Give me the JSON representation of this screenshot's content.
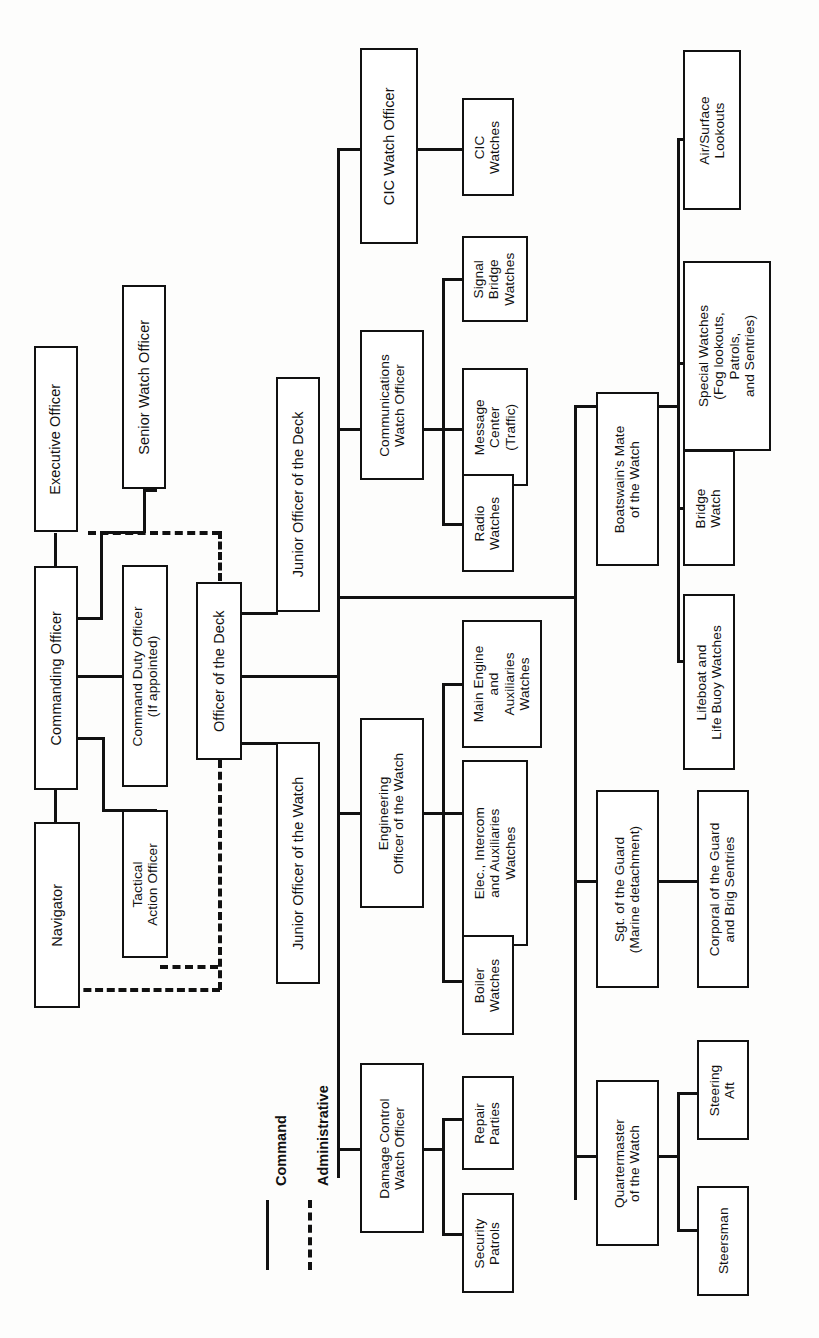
{
  "diagram": {
    "orientation": "rotated-90-counterclockwise",
    "legend": {
      "command_label": "Command",
      "command_style": "solid",
      "administrative_label": "Administrative",
      "administrative_style": "dashed"
    },
    "nodes": [
      {
        "id": "navigator",
        "label": "Navigator"
      },
      {
        "id": "commanding",
        "label": "Commanding Officer"
      },
      {
        "id": "executive",
        "label": "Executive Officer"
      },
      {
        "id": "senior_watch",
        "label": "Senior Watch Officer"
      },
      {
        "id": "command_duty",
        "label": "Command Duty Officer\n(If appointed)"
      },
      {
        "id": "tactical_action",
        "label": "Tactical\nAction Officer"
      },
      {
        "id": "ood",
        "label": "Officer of the Deck"
      },
      {
        "id": "jood",
        "label": "Junior Officer of the Deck"
      },
      {
        "id": "joow",
        "label": "Junior Officer of the Watch"
      },
      {
        "id": "cic_wo",
        "label": "CIC Watch Officer"
      },
      {
        "id": "cic_watches",
        "label": "CIC\nWatches"
      },
      {
        "id": "comm_wo",
        "label": "Communications\nWatch Officer"
      },
      {
        "id": "signal_bridge",
        "label": "Signal\nBridge\nWatches"
      },
      {
        "id": "message_center",
        "label": "Message\nCenter\n(Traffic)"
      },
      {
        "id": "radio_watches",
        "label": "Radio\nWatches"
      },
      {
        "id": "eng_oow",
        "label": "Engineering\nOfficer of the Watch"
      },
      {
        "id": "main_engine",
        "label": "Main Engine\nand\nAuxiliaries\nWatches"
      },
      {
        "id": "elec_intercom",
        "label": "Elec., Intercom\nand Auxiliaries\nWatches"
      },
      {
        "id": "boiler_watches",
        "label": "Boiler\nWatches"
      },
      {
        "id": "dc_wo",
        "label": "Damage Control\nWatch Officer"
      },
      {
        "id": "repair_parties",
        "label": "Repair\nParties"
      },
      {
        "id": "security_patrols",
        "label": "Security\nPatrols"
      },
      {
        "id": "bmow",
        "label": "Boatswain's Mate\nof the Watch"
      },
      {
        "id": "air_surface",
        "label": "Air/Surface\nLookouts"
      },
      {
        "id": "special_watches",
        "label": "Special Watches\n(Fog lookouts,\nPatrols,\nand Sentries)"
      },
      {
        "id": "bridge_watch",
        "label": "Bridge\nWatch"
      },
      {
        "id": "lifeboat",
        "label": "Lifeboat and\nLife Buoy Watches"
      },
      {
        "id": "sgt_guard",
        "label": "Sgt. of the Guard\n(Marine detachment)"
      },
      {
        "id": "corporal_guard",
        "label": "Corporal of the Guard\nand Brig Sentries"
      },
      {
        "id": "qmow",
        "label": "Quartermaster\nof the Watch"
      },
      {
        "id": "steering_aft",
        "label": "Steering\nAft"
      },
      {
        "id": "steersman",
        "label": "Steersman"
      }
    ],
    "edges": [
      {
        "from": "commanding",
        "to": "navigator",
        "type": "command"
      },
      {
        "from": "commanding",
        "to": "executive",
        "type": "command"
      },
      {
        "from": "commanding",
        "to": "command_duty",
        "type": "command"
      },
      {
        "from": "commanding",
        "to": "tactical_action",
        "type": "command"
      },
      {
        "from": "executive",
        "to": "senior_watch",
        "type": "command"
      },
      {
        "from": "senior_watch",
        "to": "ood",
        "type": "administrative"
      },
      {
        "from": "tactical_action",
        "to": "ood",
        "type": "administrative"
      },
      {
        "from": "navigator",
        "to": "ood",
        "type": "administrative"
      },
      {
        "from": "ood",
        "to": "jood",
        "type": "command"
      },
      {
        "from": "ood",
        "to": "joow",
        "type": "command"
      },
      {
        "from": "ood",
        "to": "cic_wo",
        "type": "command"
      },
      {
        "from": "ood",
        "to": "comm_wo",
        "type": "command"
      },
      {
        "from": "ood",
        "to": "eng_oow",
        "type": "command"
      },
      {
        "from": "ood",
        "to": "dc_wo",
        "type": "command"
      },
      {
        "from": "ood",
        "to": "bmow",
        "type": "command"
      },
      {
        "from": "ood",
        "to": "sgt_guard",
        "type": "command"
      },
      {
        "from": "ood",
        "to": "qmow",
        "type": "command"
      },
      {
        "from": "cic_wo",
        "to": "cic_watches",
        "type": "command"
      },
      {
        "from": "comm_wo",
        "to": "signal_bridge",
        "type": "command"
      },
      {
        "from": "comm_wo",
        "to": "message_center",
        "type": "command"
      },
      {
        "from": "comm_wo",
        "to": "radio_watches",
        "type": "command"
      },
      {
        "from": "eng_oow",
        "to": "main_engine",
        "type": "command"
      },
      {
        "from": "eng_oow",
        "to": "elec_intercom",
        "type": "command"
      },
      {
        "from": "eng_oow",
        "to": "boiler_watches",
        "type": "command"
      },
      {
        "from": "dc_wo",
        "to": "repair_parties",
        "type": "command"
      },
      {
        "from": "dc_wo",
        "to": "security_patrols",
        "type": "command"
      },
      {
        "from": "bmow",
        "to": "air_surface",
        "type": "command"
      },
      {
        "from": "bmow",
        "to": "special_watches",
        "type": "command"
      },
      {
        "from": "bmow",
        "to": "bridge_watch",
        "type": "command"
      },
      {
        "from": "bmow",
        "to": "lifeboat",
        "type": "command"
      },
      {
        "from": "sgt_guard",
        "to": "corporal_guard",
        "type": "command"
      },
      {
        "from": "qmow",
        "to": "steering_aft",
        "type": "command"
      },
      {
        "from": "qmow",
        "to": "steersman",
        "type": "command"
      }
    ]
  }
}
